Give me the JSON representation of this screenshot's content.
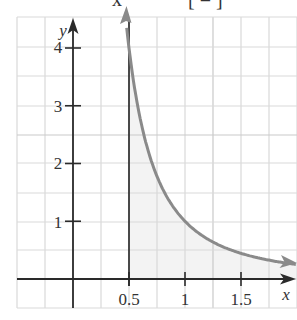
{
  "top_fragment": {
    "left_text": "x",
    "right_text": "[ = ]"
  },
  "chart_data": {
    "type": "line",
    "title": "",
    "function": "y = 1/x^2",
    "xlabel": "x",
    "ylabel": "y",
    "x_ticks": [
      0.5,
      1,
      1.5
    ],
    "x_tick_labels": [
      "0.5",
      "1",
      "1.5"
    ],
    "y_ticks": [
      1,
      2,
      3,
      4
    ],
    "y_tick_labels": [
      "1",
      "2",
      "3",
      "4"
    ],
    "xlim": [
      -0.5,
      2.0
    ],
    "ylim": [
      -0.5,
      4.5
    ],
    "grid": true,
    "grid_step_x": 0.25,
    "grid_step_y": 0.5,
    "series": [
      {
        "name": "y = 1/x^2",
        "x": [
          0.5,
          0.6,
          0.75,
          1.0,
          1.25,
          1.5,
          1.75,
          2.0
        ],
        "y": [
          4.0,
          2.78,
          1.78,
          1.0,
          0.64,
          0.44,
          0.33,
          0.25
        ],
        "color": "#8a8a8a",
        "arrows": "both ends"
      }
    ],
    "shaded_region": {
      "from_x": 0.5,
      "to_x": "inf",
      "under": "curve",
      "color": "#f3f3f3"
    },
    "vertical_line": {
      "x": 0.5,
      "color": "#222222"
    },
    "legend": null
  },
  "colors": {
    "grid": "#d9d9d9",
    "grid_major": "#c9c9c9",
    "axis": "#2a2a2a",
    "curve": "#8a8a8a",
    "shade": "#f3f3f3"
  }
}
